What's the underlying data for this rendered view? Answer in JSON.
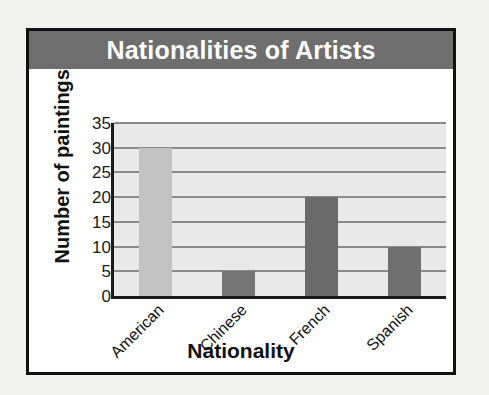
{
  "chart_data": {
    "type": "bar",
    "title": "Nationalities of Artists",
    "xlabel": "Nationality",
    "ylabel": "Number of paintings",
    "categories": [
      "American",
      "Chinese",
      "French",
      "Spanish"
    ],
    "values": [
      30,
      5,
      20,
      10
    ],
    "ylim": [
      0,
      35
    ],
    "ytick_labels": [
      "0",
      "5",
      "10",
      "15",
      "20",
      "25",
      "30",
      "35"
    ],
    "ytick_values": [
      0,
      5,
      10,
      15,
      20,
      25,
      30,
      35
    ],
    "grid": "horizontal",
    "legend": "none",
    "bar_colors": [
      "#c2c2c2",
      "#757575",
      "#6b6b6b",
      "#6f6f6f"
    ],
    "plot_background": "#e9e9e9",
    "gridline_color": "#8a8a8a",
    "axis_color": "#1a1a1a",
    "title_bar_color": "#6e6e6e",
    "title_text_color": "#ffffff",
    "card_background": "#ffffff",
    "page_background": "#f2f2f0"
  }
}
